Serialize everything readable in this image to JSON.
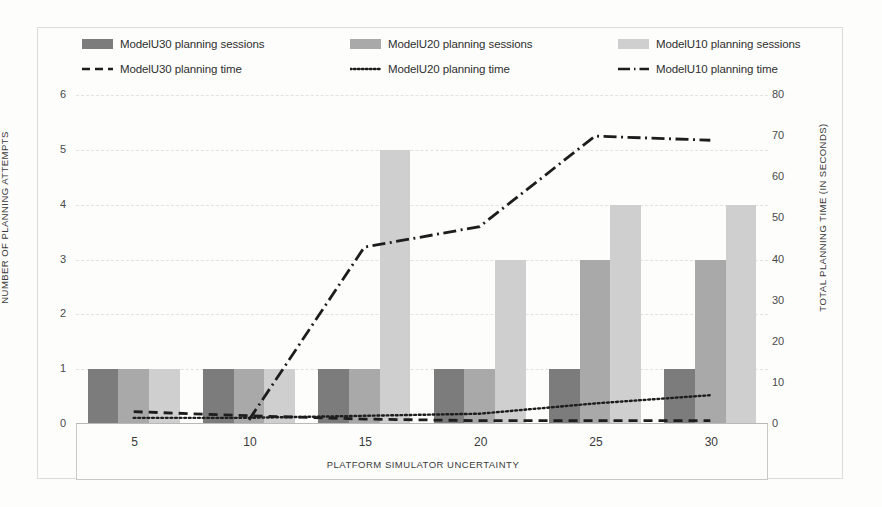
{
  "legend": {
    "rows": [
      [
        {
          "label": "ModelU30 planning sessions",
          "marker": "swatch-dark",
          "name": "legend-u30-sessions"
        },
        {
          "label": "ModelU20 planning sessions",
          "marker": "swatch-medium",
          "name": "legend-u20-sessions"
        },
        {
          "label": "ModelU10 planning sessions",
          "marker": "swatch-light",
          "name": "legend-u10-sessions"
        }
      ],
      [
        {
          "label": "ModelU30 planning time",
          "marker": "dashed-line",
          "name": "legend-u30-time"
        },
        {
          "label": "ModelU20 planning time",
          "marker": "dotted-line",
          "name": "legend-u20-time"
        },
        {
          "label": "ModelU10 planning time",
          "marker": "dashdot-line",
          "name": "legend-u10-time"
        }
      ]
    ]
  },
  "chart_data": {
    "type": "bar",
    "title": "",
    "xlabel": "PLATFORM SIMULATOR UNCERTAINTY",
    "ylabel": "NUMBER OF PLANNING ATTEMPTS",
    "y2label": "TOTAL PLANNING TIME (IN SECONDS)",
    "categories": [
      "5",
      "10",
      "15",
      "20",
      "25",
      "30"
    ],
    "x": [
      5,
      10,
      15,
      20,
      25,
      30
    ],
    "ylim": [
      0,
      6
    ],
    "yticks": [
      0,
      1,
      2,
      3,
      4,
      5,
      6
    ],
    "y2lim": [
      0,
      80
    ],
    "y2ticks": [
      0,
      10,
      20,
      30,
      40,
      50,
      60,
      70,
      80
    ],
    "grid": true,
    "legend_position": "top",
    "bar_series": [
      {
        "name": "ModelU30 planning sessions",
        "color": "#7c7c7c",
        "values": [
          1,
          1,
          1,
          1,
          1,
          1
        ]
      },
      {
        "name": "ModelU20 planning sessions",
        "color": "#a9a9a9",
        "values": [
          1,
          1,
          1,
          1,
          3,
          3
        ]
      },
      {
        "name": "ModelU10 planning sessions",
        "color": "#cfcfcf",
        "values": [
          1,
          1,
          5,
          3,
          4,
          4
        ]
      }
    ],
    "line_series": [
      {
        "name": "ModelU30 planning time",
        "axis": "y2",
        "style": "dashed",
        "color": "#1d1d1d",
        "values": [
          3,
          2,
          1.2,
          0.8,
          0.8,
          0.8
        ]
      },
      {
        "name": "ModelU20 planning time",
        "axis": "y2",
        "style": "dotted",
        "color": "#1d1d1d",
        "values": [
          1.5,
          1.5,
          2,
          2.5,
          5,
          7
        ]
      },
      {
        "name": "ModelU10 planning time",
        "axis": "y2",
        "style": "dashdot",
        "color": "#1d1d1d",
        "values": [
          null,
          1,
          43,
          48,
          70,
          69
        ]
      }
    ]
  },
  "colors": {
    "u30": "#7c7c7c",
    "u20": "#a9a9a9",
    "u10": "#cfcfcf",
    "line": "#1d1d1d",
    "grid": "#e2e2de",
    "background": "#fdfdfc"
  }
}
